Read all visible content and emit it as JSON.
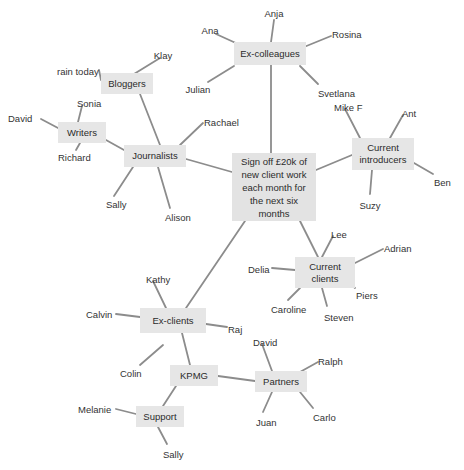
{
  "diagram": {
    "title": "Sign off £20k of new client work each month for the next six months",
    "type": "mind-map",
    "background_color": "#ffffff",
    "node_fill_color": "#e6e6e6",
    "edge_color": "#8c8c8c",
    "text_color": "#333333",
    "nodes": [
      {
        "id": "central",
        "label": "Sign off £20k of\nnew client work\neach month for\nthe next six\nmonths",
        "x": 232,
        "y": 153,
        "w": 84,
        "h": 68,
        "central": true
      },
      {
        "id": "excolleagues",
        "label": "Ex-colleagues",
        "x": 234,
        "y": 42,
        "w": 72,
        "h": 23
      },
      {
        "id": "bloggers",
        "label": "Bloggers",
        "x": 101,
        "y": 73,
        "w": 52,
        "h": 21
      },
      {
        "id": "writers",
        "label": "Writers",
        "x": 58,
        "y": 122,
        "w": 48,
        "h": 21
      },
      {
        "id": "journalists",
        "label": "Journalists",
        "x": 124,
        "y": 145,
        "w": 62,
        "h": 22
      },
      {
        "id": "introducers",
        "label": "Current\nintroducers",
        "x": 352,
        "y": 138,
        "w": 62,
        "h": 32
      },
      {
        "id": "clients",
        "label": "Current\nclients",
        "x": 295,
        "y": 257,
        "w": 60,
        "h": 31
      },
      {
        "id": "exclients",
        "label": "Ex-clients",
        "x": 140,
        "y": 308,
        "w": 66,
        "h": 25
      },
      {
        "id": "kpmg",
        "label": "KPMG",
        "x": 170,
        "y": 365,
        "w": 48,
        "h": 21
      },
      {
        "id": "partners",
        "label": "Partners",
        "x": 255,
        "y": 371,
        "w": 52,
        "h": 21
      },
      {
        "id": "support",
        "label": "Support",
        "x": 136,
        "y": 406,
        "w": 48,
        "h": 21
      }
    ],
    "leaves": [
      {
        "label": "Anja",
        "x": 274,
        "y": 8,
        "anchor": "middle",
        "lx": 274,
        "ly": 20,
        "tx": 271,
        "ty": 42
      },
      {
        "label": "Ana",
        "x": 210,
        "y": 25,
        "anchor": "middle",
        "lx": 216,
        "ly": 34,
        "tx": 238,
        "ty": 44
      },
      {
        "label": "Rosina",
        "x": 332,
        "y": 29,
        "anchor": "start",
        "lx": 331,
        "ly": 36,
        "tx": 304,
        "ty": 47
      },
      {
        "label": "Klay",
        "x": 163,
        "y": 50,
        "anchor": "middle",
        "lx": 160,
        "ly": 58,
        "tx": 134,
        "ty": 74
      },
      {
        "label": "rain today",
        "x": 57,
        "y": 66,
        "anchor": "start",
        "lx": 99,
        "ly": 70,
        "tx": 101,
        "ty": 80
      },
      {
        "label": "Julian",
        "x": 198,
        "y": 84,
        "anchor": "middle",
        "lx": 208,
        "ly": 82,
        "tx": 234,
        "ty": 66
      },
      {
        "label": "Svetlana",
        "x": 318,
        "y": 88,
        "anchor": "start",
        "lx": 318,
        "ly": 84,
        "tx": 300,
        "ty": 66
      },
      {
        "label": "Mike F",
        "x": 334,
        "y": 102,
        "anchor": "start",
        "lx": 345,
        "ly": 109,
        "tx": 360,
        "ty": 138
      },
      {
        "label": "Ant",
        "x": 402,
        "y": 108,
        "anchor": "start",
        "lx": 403,
        "ly": 115,
        "tx": 390,
        "ty": 138
      },
      {
        "label": "David",
        "x": 8,
        "y": 113,
        "anchor": "start",
        "lx": 41,
        "ly": 119,
        "tx": 58,
        "ty": 128
      },
      {
        "label": "Sonia",
        "x": 77,
        "y": 98,
        "anchor": "start",
        "lx": 82,
        "ly": 106,
        "tx": 78,
        "ty": 122
      },
      {
        "label": "Rachael",
        "x": 204,
        "y": 117,
        "anchor": "start",
        "lx": 203,
        "ly": 123,
        "tx": 180,
        "ty": 145
      },
      {
        "label": "Richard",
        "x": 58,
        "y": 152,
        "anchor": "start",
        "lx": 76,
        "ly": 150,
        "tx": 80,
        "ty": 143
      },
      {
        "label": "Ben",
        "x": 434,
        "y": 177,
        "anchor": "start",
        "lx": 433,
        "ly": 174,
        "tx": 414,
        "ty": 163
      },
      {
        "label": "Suzy",
        "x": 370,
        "y": 200,
        "anchor": "middle",
        "lx": 370,
        "ly": 194,
        "tx": 372,
        "ty": 170
      },
      {
        "label": "Sally",
        "x": 106,
        "y": 199,
        "anchor": "start",
        "lx": 114,
        "ly": 196,
        "tx": 133,
        "ty": 167
      },
      {
        "label": "Alison",
        "x": 165,
        "y": 212,
        "anchor": "start",
        "lx": 170,
        "ly": 208,
        "tx": 158,
        "ty": 167
      },
      {
        "label": "Lee",
        "x": 331,
        "y": 229,
        "anchor": "start",
        "lx": 333,
        "ly": 236,
        "tx": 322,
        "ty": 257
      },
      {
        "label": "Adrian",
        "x": 384,
        "y": 243,
        "anchor": "start",
        "lx": 383,
        "ly": 249,
        "tx": 355,
        "ty": 263
      },
      {
        "label": "Delia",
        "x": 248,
        "y": 264,
        "anchor": "start",
        "lx": 272,
        "ly": 268,
        "tx": 295,
        "ty": 270
      },
      {
        "label": "Kathy",
        "x": 146,
        "y": 274,
        "anchor": "start",
        "lx": 153,
        "ly": 281,
        "tx": 166,
        "ty": 308
      },
      {
        "label": "Piers",
        "x": 356,
        "y": 290,
        "anchor": "start",
        "lx": 355,
        "ly": 288,
        "tx": 347,
        "ty": 281
      },
      {
        "label": "Caroline",
        "x": 271,
        "y": 304,
        "anchor": "start",
        "lx": 288,
        "ly": 300,
        "tx": 300,
        "ty": 288
      },
      {
        "label": "Steven",
        "x": 324,
        "y": 312,
        "anchor": "start",
        "lx": 327,
        "ly": 306,
        "tx": 322,
        "ty": 288
      },
      {
        "label": "Calvin",
        "x": 86,
        "y": 309,
        "anchor": "start",
        "lx": 116,
        "ly": 314,
        "tx": 140,
        "ty": 317
      },
      {
        "label": "Raj",
        "x": 228,
        "y": 324,
        "anchor": "start",
        "lx": 227,
        "ly": 327,
        "tx": 206,
        "ty": 324
      },
      {
        "label": "David",
        "x": 253,
        "y": 337,
        "anchor": "start",
        "lx": 262,
        "ly": 344,
        "tx": 272,
        "ty": 371
      },
      {
        "label": "Ralph",
        "x": 318,
        "y": 356,
        "anchor": "start",
        "lx": 318,
        "ly": 362,
        "tx": 300,
        "ty": 372
      },
      {
        "label": "Colin",
        "x": 120,
        "y": 368,
        "anchor": "start",
        "lx": 140,
        "ly": 365,
        "tx": 163,
        "ly2": 0,
        "ty": 345
      },
      {
        "label": "Melanie",
        "x": 78,
        "y": 404,
        "anchor": "start",
        "lx": 116,
        "ly": 409,
        "tx": 136,
        "ty": 414
      },
      {
        "label": "Carlo",
        "x": 313,
        "y": 412,
        "anchor": "start",
        "lx": 313,
        "ly": 408,
        "tx": 300,
        "ty": 392
      },
      {
        "label": "Juan",
        "x": 256,
        "y": 417,
        "anchor": "start",
        "lx": 263,
        "ly": 412,
        "tx": 272,
        "ty": 392
      },
      {
        "label": "Sally",
        "x": 163,
        "y": 449,
        "anchor": "start",
        "lx": 167,
        "ly": 444,
        "tx": 158,
        "ty": 427
      }
    ],
    "node_edges": [
      {
        "from": "central",
        "to": "excolleagues",
        "x1": 271,
        "y1": 153,
        "x2": 271,
        "y2": 65
      },
      {
        "from": "central",
        "to": "journalists",
        "x1": 232,
        "y1": 172,
        "x2": 186,
        "y2": 159
      },
      {
        "from": "central",
        "to": "introducers",
        "x1": 316,
        "y1": 170,
        "x2": 352,
        "y2": 155
      },
      {
        "from": "central",
        "to": "clients",
        "x1": 300,
        "y1": 221,
        "x2": 318,
        "y2": 257
      },
      {
        "from": "central",
        "to": "exclients",
        "x1": 245,
        "y1": 221,
        "x2": 186,
        "y2": 308
      },
      {
        "from": "journalists",
        "to": "bloggers",
        "x1": 160,
        "y1": 145,
        "x2": 140,
        "y2": 94
      },
      {
        "from": "journalists",
        "to": "writers",
        "x1": 124,
        "y1": 150,
        "x2": 106,
        "y2": 140
      },
      {
        "from": "exclients",
        "to": "kpmg",
        "x1": 182,
        "y1": 333,
        "x2": 190,
        "y2": 365
      },
      {
        "from": "kpmg",
        "to": "partners",
        "x1": 218,
        "y1": 376,
        "x2": 255,
        "y2": 381
      },
      {
        "from": "kpmg",
        "to": "support",
        "x1": 176,
        "y1": 386,
        "x2": 163,
        "y2": 406
      }
    ]
  }
}
